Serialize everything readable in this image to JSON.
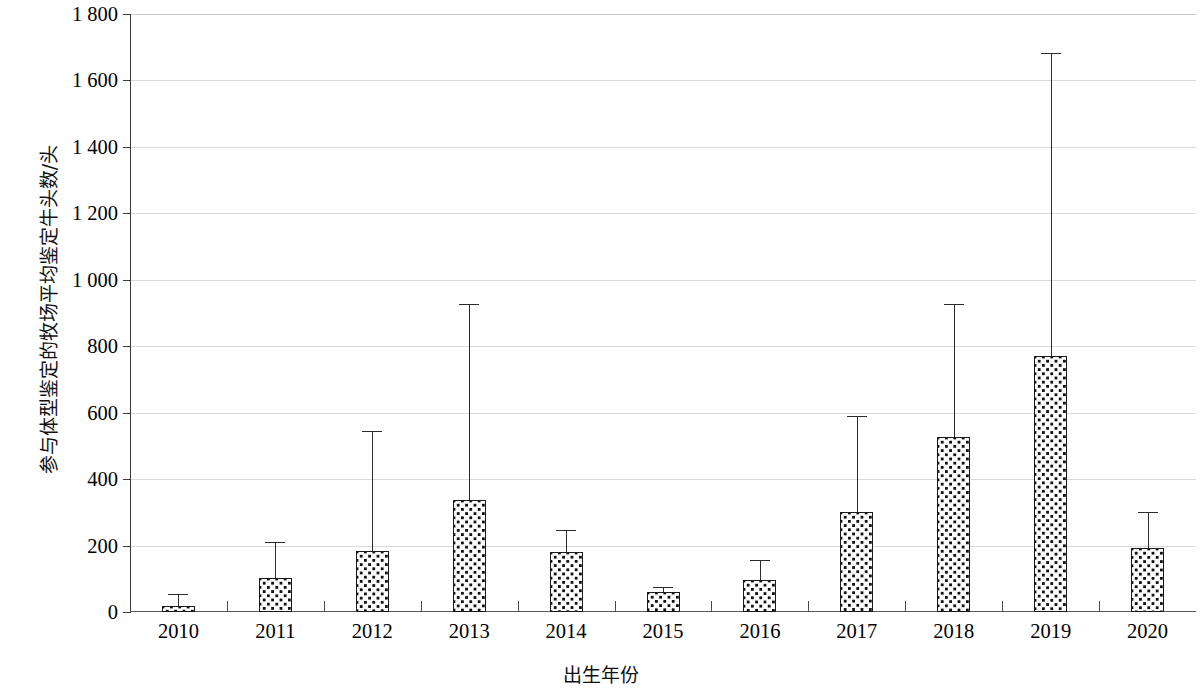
{
  "chart_data": {
    "type": "bar",
    "title": "",
    "xlabel": "出生年份",
    "ylabel": "参与体型鉴定的牧场平均鉴定牛头数/头",
    "categories": [
      "2010",
      "2011",
      "2012",
      "2013",
      "2014",
      "2015",
      "2016",
      "2017",
      "2018",
      "2019",
      "2020"
    ],
    "values": [
      18,
      102,
      183,
      338,
      180,
      60,
      95,
      300,
      528,
      770,
      193
    ],
    "error_upper": [
      54,
      212,
      545,
      928,
      247,
      75,
      158,
      590,
      928,
      1682,
      302
    ],
    "ylim": [
      0,
      1800
    ],
    "ytick_values": [
      0,
      200,
      400,
      600,
      800,
      1000,
      1200,
      1400,
      1600,
      1800
    ],
    "ytick_labels": [
      "0",
      "200",
      "400",
      "600",
      "800",
      "1 000",
      "1 200",
      "1 400",
      "1 600",
      "1 800"
    ],
    "grid": true,
    "legend": "none",
    "bar_fill": "dotted-pattern",
    "bar_fill_color": "#fdfdfd",
    "bar_border_color": "#1a1a1a",
    "gridline_color": "#d9d9d9",
    "error_bar_color": "#2b2b2b",
    "error_bar_type": "upper-only"
  }
}
